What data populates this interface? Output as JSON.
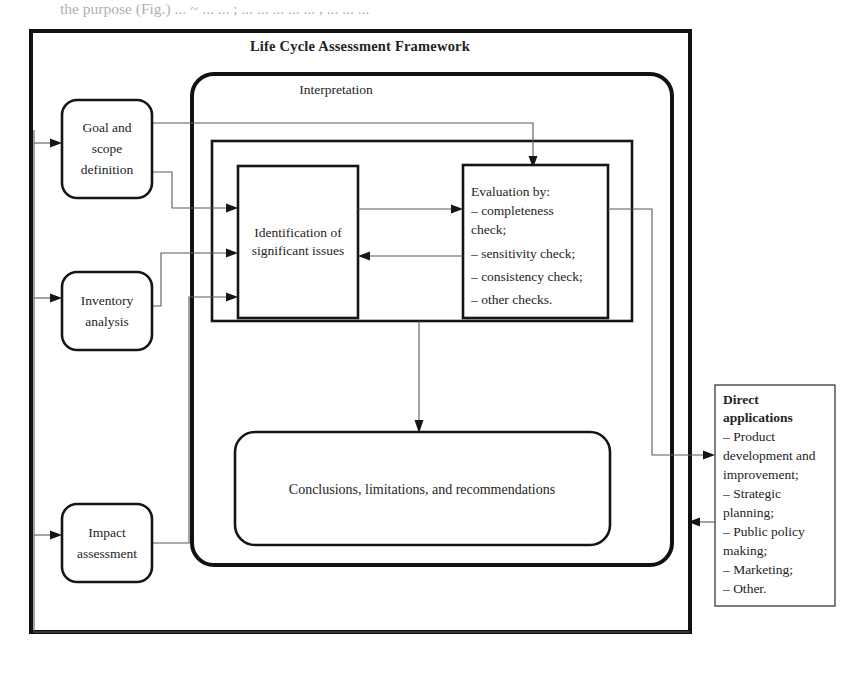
{
  "page": {
    "partial_text_top": "the purpose (Fig.)   ... ~ ... ...  ;     ... ... ... ... ... , ... ... ...",
    "background_color": "#ffffff",
    "line_color": "#111111",
    "connector_color": "#5a5a5a"
  },
  "framework": {
    "title": "Life Cycle Assessment Framework"
  },
  "interpretation": {
    "title": "Interpretation"
  },
  "phases": [
    {
      "id": "goal-and-scope-definition",
      "lines": [
        "Goal and",
        "scope",
        "definition"
      ]
    },
    {
      "id": "inventory-analysis",
      "lines": [
        "Inventory",
        "analysis"
      ]
    },
    {
      "id": "impact-assessment",
      "lines": [
        "Impact",
        "assessment"
      ]
    }
  ],
  "identification": {
    "lines": [
      "Identification of",
      "significant issues"
    ]
  },
  "evaluation": {
    "heading": "Evaluation by:",
    "items": [
      "– completeness",
      "   check;",
      "– sensitivity check;",
      "– consistency check;",
      "– other checks."
    ]
  },
  "conclusions": {
    "text": "Conclusions, limitations, and recommendations"
  },
  "direct_applications": {
    "heading_lines": [
      "Direct",
      "applications"
    ],
    "items": [
      "– Product",
      "   development and",
      "   improvement;",
      "– Strategic",
      "   planning;",
      "– Public policy",
      "   making;",
      "– Marketing;",
      "– Other."
    ]
  }
}
